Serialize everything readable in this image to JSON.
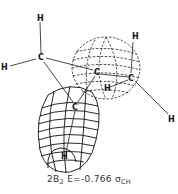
{
  "figure": {
    "type": "molecular-orbital-plot",
    "atoms": [
      {
        "id": "H1",
        "label": "H",
        "x": 40,
        "y": 18
      },
      {
        "id": "C1",
        "label": "C",
        "x": 41,
        "y": 60
      },
      {
        "id": "H2",
        "label": "H",
        "x": 4,
        "y": 70
      },
      {
        "id": "C2",
        "label": "C",
        "x": 97,
        "y": 75
      },
      {
        "id": "C3",
        "label": "C",
        "x": 131,
        "y": 81
      },
      {
        "id": "H3",
        "label": "H",
        "x": 135,
        "y": 38
      },
      {
        "id": "H4",
        "label": "H",
        "x": 171,
        "y": 121
      },
      {
        "id": "H5",
        "label": "H",
        "x": 107,
        "y": 90
      },
      {
        "id": "C4",
        "label": "C",
        "x": 75,
        "y": 109
      },
      {
        "id": "H6",
        "label": "H",
        "x": 64,
        "y": 158
      }
    ],
    "lobes": [
      {
        "name": "dashed-lobe",
        "style": "dashed",
        "cx": 106,
        "cy": 68,
        "rx": 34,
        "ry": 31
      },
      {
        "name": "solid-lobe",
        "style": "solid",
        "cx": 67,
        "cy": 128,
        "rx": 30,
        "ry": 46
      }
    ],
    "line_color": "#1a1a1a"
  },
  "caption": {
    "state_prefix": "2B",
    "state_sub": "2",
    "energy": "E=-0.766",
    "orbital_symbol": "σ",
    "orbital_sub": "CH"
  }
}
